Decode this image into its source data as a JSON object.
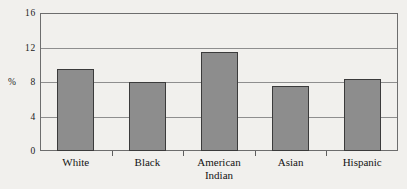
{
  "chart_data": {
    "type": "bar",
    "title": "",
    "subtitle": "",
    "xlabel": "",
    "ylabel": "%",
    "categories": [
      "White",
      "Black",
      "American\nIndian",
      "Asian",
      "Hispanic"
    ],
    "values": [
      9.5,
      8.0,
      11.5,
      7.5,
      8.3
    ],
    "ylim": [
      0,
      16
    ],
    "yticks": [
      0,
      4,
      8,
      12,
      16
    ],
    "ytick_labels": [
      "0",
      "4",
      "8",
      "12",
      "16"
    ],
    "grid": true,
    "legend": false,
    "series": [
      {
        "name": "",
        "values": [
          9.5,
          8.0,
          11.5,
          7.5,
          8.3
        ]
      }
    ],
    "colors": {
      "bar_fill": "#8d8d8d",
      "bar_edge": "#3b3b3b",
      "gridline": "#8e8e8e",
      "frame": "#6d6d6d",
      "background": "#f1f0ed",
      "text": "#141414"
    }
  }
}
